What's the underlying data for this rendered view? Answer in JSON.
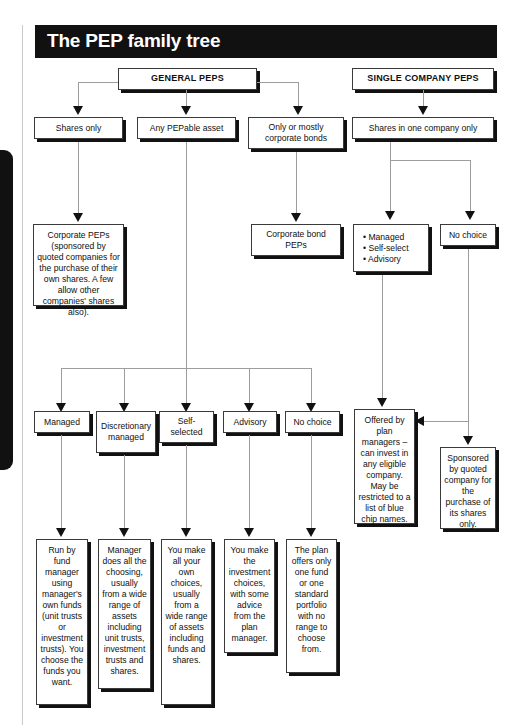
{
  "page": {
    "title": "The PEP family tree",
    "thumb_tab_color": "#111111",
    "banner_color": "#111111",
    "banner_text_color": "#ffffff"
  },
  "diagram": {
    "type": "flowchart",
    "headers": [
      {
        "id": "general-peps",
        "label": "GENERAL PEPS"
      },
      {
        "id": "single-company-peps",
        "label": "SINGLE COMPANY PEPS"
      }
    ],
    "level1": [
      {
        "id": "shares-only",
        "label": "Shares only",
        "parent": "general-peps"
      },
      {
        "id": "any-pepable-asset",
        "label": "Any PEPable asset",
        "parent": "general-peps"
      },
      {
        "id": "corporate-bonds",
        "label": "Only or mostly corporate bonds",
        "parent": "general-peps"
      },
      {
        "id": "shares-one-company",
        "label": "Shares in one company only",
        "parent": "single-company-peps"
      }
    ],
    "level2": [
      {
        "id": "corporate-peps",
        "label": "Corporate PEPs (sponsored by quoted companies for the purchase of their own shares. A few allow other companies' shares also).",
        "parent": "shares-only"
      },
      {
        "id": "corporate-bond-peps",
        "label": "Corporate bond PEPs",
        "parent": "corporate-bonds"
      },
      {
        "id": "managed-self-advisory",
        "bullets": [
          "Managed",
          "Self-select",
          "Advisory"
        ],
        "parent": "shares-one-company"
      },
      {
        "id": "no-choice-single",
        "label": "No choice",
        "parent": "shares-one-company"
      }
    ],
    "level3": [
      {
        "id": "managed",
        "label": "Managed",
        "parent": "any-pepable-asset"
      },
      {
        "id": "discretionary-managed",
        "label": "Discretionary managed",
        "parent": "any-pepable-asset"
      },
      {
        "id": "self-selected",
        "label": "Self-selected",
        "parent": "any-pepable-asset"
      },
      {
        "id": "advisory",
        "label": "Advisory",
        "parent": "any-pepable-asset"
      },
      {
        "id": "no-choice",
        "label": "No choice",
        "parent": "any-pepable-asset"
      },
      {
        "id": "offered-by-plan-managers",
        "label": "Offered by plan managers – can invest in any eligible company. May be restricted to a list of blue chip names.",
        "parent": "managed-self-advisory"
      },
      {
        "id": "sponsored-by-quoted-company",
        "label": "Sponsored by quoted company for the purchase of its shares only.",
        "parent": "no-choice-single"
      }
    ],
    "level4": [
      {
        "id": "managed-detail",
        "label": "Run by fund manager using manager's own funds (unit trusts or investment trusts). You choose the funds you want.",
        "parent": "managed"
      },
      {
        "id": "discretionary-detail",
        "label": "Manager does all the choosing, usually from a wide range of assets including unit trusts, investment trusts and shares.",
        "parent": "discretionary-managed"
      },
      {
        "id": "self-selected-detail",
        "label": "You make all your own choices, usually from a wide range of assets including funds and shares.",
        "parent": "self-selected"
      },
      {
        "id": "advisory-detail",
        "label": "You make the investment choices, with some advice from the plan manager.",
        "parent": "advisory"
      },
      {
        "id": "no-choice-detail",
        "label": "The plan offers only one fund or one standard portfolio with no range to choose from.",
        "parent": "no-choice"
      }
    ]
  }
}
